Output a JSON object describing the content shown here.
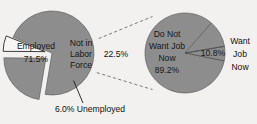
{
  "figure": {
    "title": "",
    "background_color": "#f2f1ef",
    "wedge_fill_color": "#8d8d8d",
    "wedge_highlight_color": "#f6f5f3",
    "text_color": "#1d1d1d"
  },
  "chart_data": {
    "type": "pie",
    "title": "",
    "subtitle": "",
    "xlabel": "",
    "ylabel": "",
    "legend_position": "none",
    "grid": false,
    "note": "Pie-of-pie: the 'Not in Labor Force' slice of the left pie is exploded out and expanded into the right pie.",
    "charts": [
      {
        "name": "civilian-population-pie",
        "position": "left",
        "center": [
          52,
          53
        ],
        "radius": 42,
        "slices": [
          {
            "label": "Employed",
            "value": 71.5,
            "value_label": "71.5%",
            "color": "#8d8d8d",
            "exploded": false,
            "label_position": "inside"
          },
          {
            "label": "Not in Labor Force",
            "value": 22.5,
            "value_label": "22.5%",
            "color": "#8d8d8d",
            "exploded": true,
            "label_position": "inside-name-outside-value"
          },
          {
            "label": "Unemployed",
            "value": 6.0,
            "value_label": "6.0%",
            "color": "#f6f5f3",
            "exploded": true,
            "label_position": "callout-below"
          }
        ]
      },
      {
        "name": "not-in-labor-force-pie",
        "position": "right",
        "center": [
          185,
          53
        ],
        "radius": 40,
        "slices": [
          {
            "label": "Do Not Want Job Now",
            "value": 89.2,
            "value_label": "89.2%",
            "color": "#8d8d8d",
            "exploded": false,
            "label_position": "inside"
          },
          {
            "label": "Want Job Now",
            "value": 10.8,
            "value_label": "10.8%",
            "color": "#8d8d8d",
            "exploded": false,
            "label_position": "outside-right"
          }
        ]
      }
    ]
  },
  "labels": {
    "employed_name": "Employed",
    "employed_value": "71.5%",
    "nilf_line1": "Not in",
    "nilf_line2": "Labor",
    "nilf_line3": "Force",
    "nilf_value": "22.5%",
    "unemployed_callout": "6.0% Unemployed",
    "dnwjn_line1": "Do Not",
    "dnwjn_line2": "Want Job",
    "dnwjn_line3": "Now",
    "dnwjn_value": "89.2%",
    "wjn_value": "10.8%",
    "wjn_line1": "Want",
    "wjn_line2": "Job",
    "wjn_line3": "Now"
  }
}
